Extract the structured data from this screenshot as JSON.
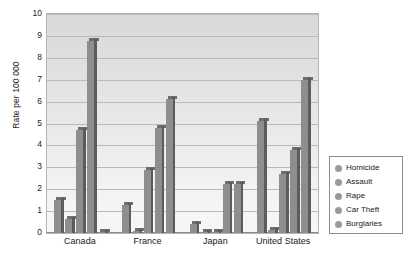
{
  "chart_data": {
    "type": "bar",
    "title": "",
    "xlabel": "",
    "ylabel": "Rate per 100 000",
    "ylim": [
      0,
      10
    ],
    "yticks": [
      0,
      1,
      2,
      3,
      4,
      5,
      6,
      7,
      8,
      9,
      10
    ],
    "grid": true,
    "legend_position": "right",
    "categories": [
      "Canada",
      "France",
      "Japan",
      "United States"
    ],
    "series": [
      {
        "name": "Homicide",
        "values": [
          1.5,
          1.3,
          0.4,
          5.1
        ]
      },
      {
        "name": "Assault",
        "values": [
          0.65,
          0.1,
          0.05,
          0.15
        ]
      },
      {
        "name": "Rape",
        "values": [
          4.7,
          2.9,
          0.05,
          2.7
        ]
      },
      {
        "name": "Car Theft",
        "values": [
          8.75,
          4.8,
          2.25,
          3.8
        ]
      },
      {
        "name": "Burglaries",
        "values": [
          0.05,
          6.1,
          2.25,
          7.0
        ]
      }
    ]
  },
  "axes": {
    "y_title": "Rate per 100 000",
    "y_tick_labels": [
      "10",
      "9",
      "8",
      "7",
      "6",
      "5",
      "4",
      "3",
      "2",
      "1",
      "0"
    ],
    "x_tick_labels": [
      "Canada",
      "France",
      "Japan",
      "United States"
    ]
  },
  "legend": {
    "items": [
      {
        "label": "Homicide",
        "color": "#9a9a9a"
      },
      {
        "label": "Assault",
        "color": "#9a9a9a"
      },
      {
        "label": "Rape",
        "color": "#9a9a9a"
      },
      {
        "label": "Car Theft",
        "color": "#9a9a9a"
      },
      {
        "label": "Burglaries",
        "color": "#9a9a9a"
      }
    ]
  },
  "style": {
    "bar_face": "#8e8e8e",
    "bar_side": "#5c5c5c",
    "bar_top": "#6e6e6e",
    "plot_bg_top": "#d9d9d9",
    "plot_bg_bottom": "#f7f7f7",
    "gridline": "#b9b9b9",
    "frame": "#b5b5b5",
    "text": "#1a1a1a"
  }
}
